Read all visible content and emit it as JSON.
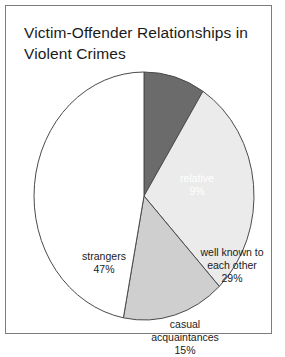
{
  "figure": {
    "title": "Victim-Offender Relationships in\nViolent Crimes",
    "frame_color": "#7c7c7c",
    "background": "#ffffff"
  },
  "chart_data": {
    "type": "pie",
    "title": "Victim-Offender Relationships in Violent Crimes",
    "xlabel": "",
    "ylabel": "",
    "units": "percent",
    "start_angle_deg": 0,
    "direction": "clockwise",
    "legend": "none",
    "grid": false,
    "total": 100,
    "categories": [
      "relative",
      "well known to each other",
      "casual acquaintances",
      "strangers"
    ],
    "values": [
      9,
      29,
      15,
      47
    ],
    "slices": [
      {
        "label": "relative",
        "value": 9,
        "value_text": "9%",
        "label_text": "relative\n9%",
        "color": "#6b6b6b",
        "text_color": "#ffffff"
      },
      {
        "label": "well known to each other",
        "value": 29,
        "value_text": "29%",
        "label_text": "well known to\neach other\n29%",
        "color": "#ebebeb",
        "text_color": "#1a1a1a"
      },
      {
        "label": "casual acquaintances",
        "value": 15,
        "value_text": "15%",
        "label_text": "casual\nacquaintances\n15%",
        "color": "#cfcfcf",
        "text_color": "#1a1a1a"
      },
      {
        "label": "strangers",
        "value": 47,
        "value_text": "47%",
        "label_text": "strangers\n47%",
        "color": "#ffffff",
        "text_color": "#1a1a1a"
      }
    ]
  }
}
